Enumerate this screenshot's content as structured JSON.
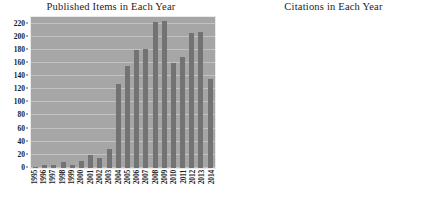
{
  "page": {
    "background": "#ffffff",
    "bar_color": "#737373",
    "plot_background": "#a6a6a6",
    "gridline_color": "#c2c2c2",
    "text_color": "#1c1c1c"
  },
  "chart_data": [
    {
      "type": "bar",
      "id": "published-items",
      "title": "Published Items in Each Year",
      "xlabel": "",
      "ylabel": "",
      "ylim": [
        0,
        230
      ],
      "grid": true,
      "legend": "none",
      "yticks": [
        0,
        20,
        40,
        60,
        80,
        100,
        120,
        140,
        160,
        180,
        200,
        220
      ],
      "categories": [
        "1995",
        "1996",
        "1997",
        "1998",
        "1999",
        "2000",
        "2001",
        "2002",
        "2003",
        "2004",
        "2005",
        "2006",
        "2007",
        "2008",
        "2009",
        "2010",
        "2011",
        "2012",
        "2013",
        "2014"
      ],
      "values": [
        1,
        5,
        5,
        9,
        5,
        11,
        20,
        16,
        29,
        128,
        156,
        179,
        182,
        223,
        224,
        160,
        169,
        206,
        207,
        136
      ]
    },
    {
      "type": "bar",
      "id": "citations",
      "title": "Citations in Each Year",
      "xlabel": "",
      "ylabel": "",
      "ylim": [
        0,
        4000
      ],
      "grid": true,
      "legend": "none",
      "yticks": [
        0,
        500,
        1000,
        1500,
        2000,
        2500,
        3000,
        3500,
        4000
      ],
      "categories": [
        "1996",
        "1997",
        "1998",
        "1999",
        "2000",
        "2001",
        "2002",
        "2003",
        "2004",
        "2005",
        "2006",
        "2007",
        "2008",
        "2009",
        "2010",
        "2011",
        "2012",
        "2013",
        "2014",
        "2015"
      ],
      "values": [
        5,
        20,
        30,
        25,
        110,
        225,
        280,
        465,
        720,
        1040,
        1330,
        1910,
        2180,
        2360,
        2195,
        2540,
        3135,
        3805,
        2645,
        0
      ]
    }
  ]
}
